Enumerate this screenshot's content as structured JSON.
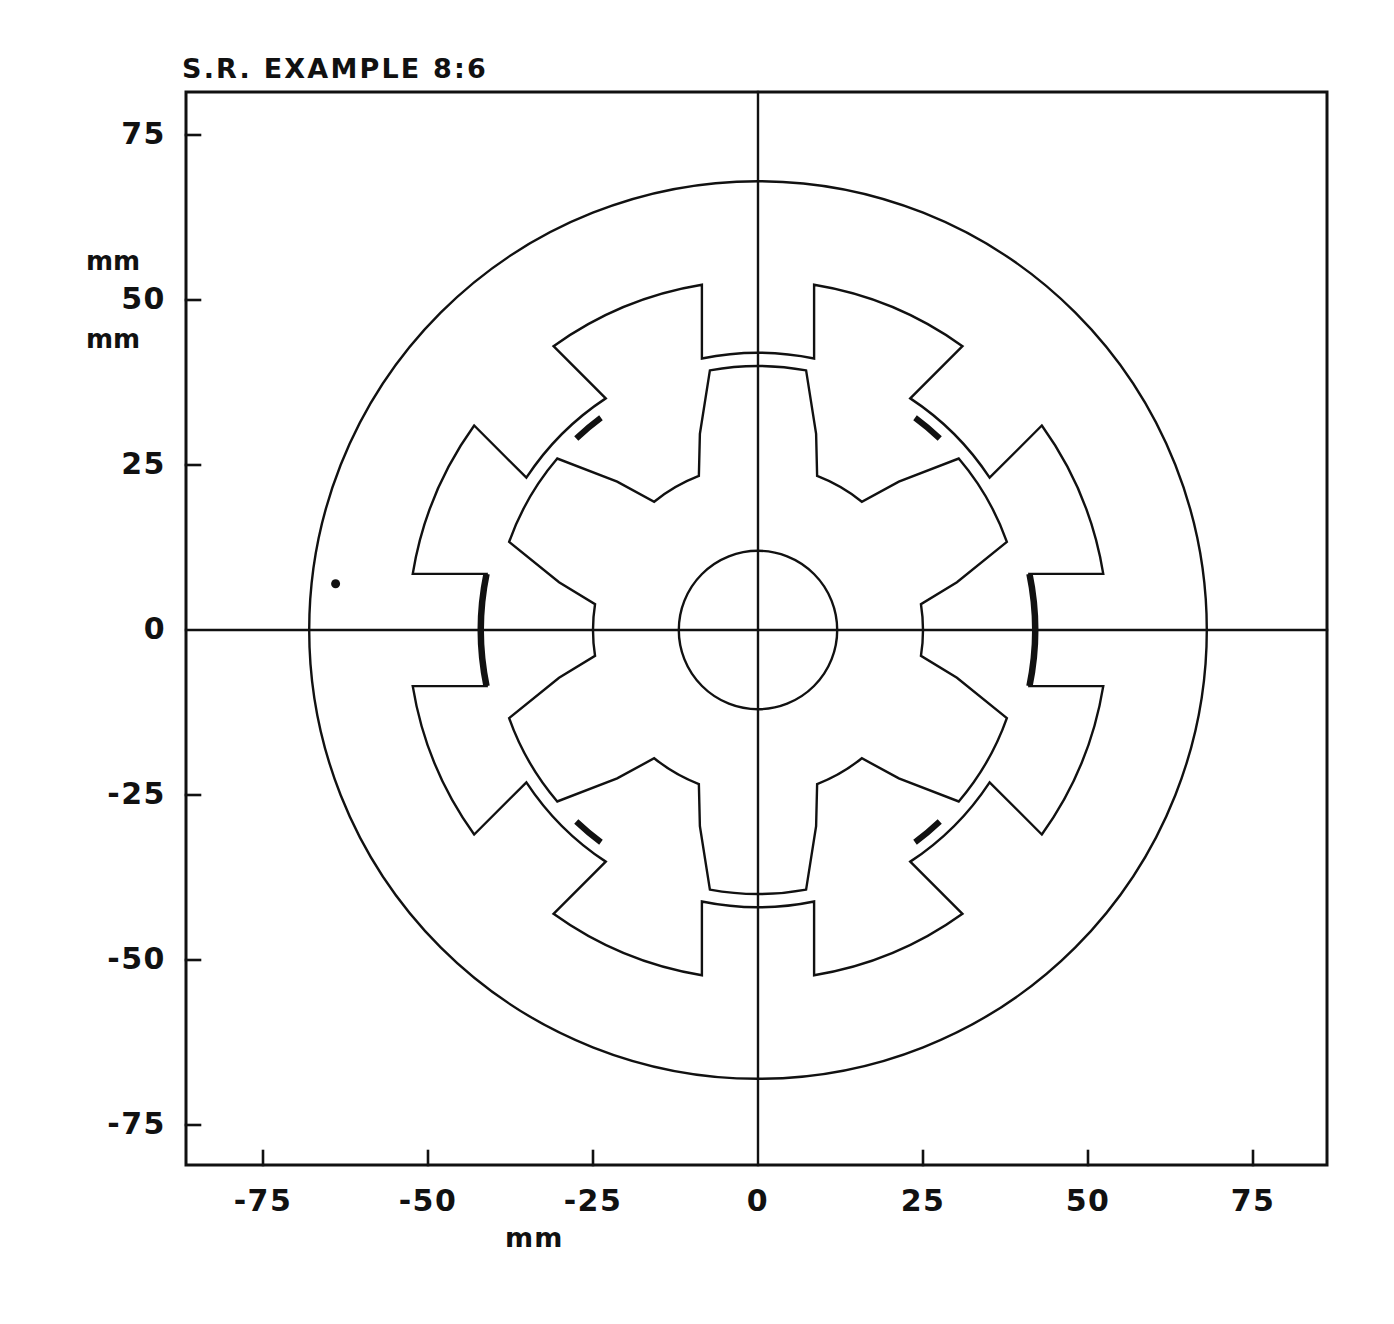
{
  "chart_data": {
    "type": "diagram",
    "title": "S.R. EXAMPLE 8:6",
    "subtitle": "",
    "xlabel": "mm",
    "ylabel": "mm",
    "xlim": [
      -88,
      86
    ],
    "ylim": [
      -81,
      81
    ],
    "grid": false,
    "legend": null,
    "xticks": [
      -75,
      -50,
      -25,
      0,
      25,
      50,
      75
    ],
    "xtick_labels": [
      "-75",
      "-50",
      "-25",
      "0",
      "25",
      "50",
      "75"
    ],
    "yticks": [
      75,
      50,
      25,
      0,
      -25,
      -50,
      -75
    ],
    "ytick_labels": [
      "75",
      "50",
      "25",
      "0",
      "-25",
      "-50",
      "-75"
    ],
    "axis_lines": {
      "vertical_x": 0,
      "horizontal_y": 0
    },
    "machine": {
      "name": "switched reluctance motor cross-section",
      "stator_poles": 8,
      "rotor_poles": 6,
      "stator_outer_radius_mm": 68,
      "stator_yoke_inner_radius_mm": 53,
      "stator_slot_outer_radius_mm": 53,
      "stator_pole_tip_radius_mm": 42,
      "stator_pole_arc_deg": 18,
      "stator_pole_body_half_width_mm": 8.5,
      "stator_pole_offset_deg": 0,
      "rotor_outer_radius_mm": 40,
      "rotor_pole_arc_deg": 21,
      "rotor_yoke_radius_mm": 25,
      "rotor_pole_flank_radius_mm": 31,
      "shaft_radius_mm": 12,
      "rotor_offset_deg": 30,
      "airgap_mm": 2
    },
    "markers": [
      {
        "name": "reference-point",
        "x_mm": -64,
        "y_mm": 7,
        "size_px": 9
      }
    ],
    "highlighted_arcs": [
      {
        "name": "thick-pole-arc",
        "center_deg": 0,
        "radius_mm": 42
      },
      {
        "name": "thick-pole-arc",
        "center_deg": 180,
        "radius_mm": 42
      },
      {
        "name": "thick-rotor-arc",
        "center_deg": 50,
        "radius_mm": 40
      },
      {
        "name": "thick-rotor-arc",
        "center_deg": 130,
        "radius_mm": 40
      },
      {
        "name": "thick-rotor-arc",
        "center_deg": 230,
        "radius_mm": 40
      },
      {
        "name": "thick-rotor-arc",
        "center_deg": 310,
        "radius_mm": 40
      }
    ],
    "colors": {
      "line": "#111111",
      "background": "#ffffff",
      "text": "#111111"
    }
  }
}
